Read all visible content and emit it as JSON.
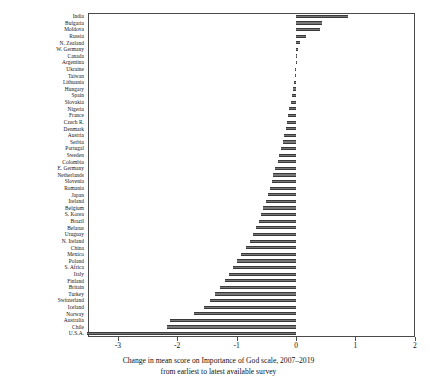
{
  "caption": {
    "line1": "Change in mean score on Importance of God scale, 2007–2019",
    "line2": "from earliest to latest available survey"
  },
  "axis": {
    "ticks": [
      "-3",
      "-2",
      "-1",
      "0",
      "1",
      "2"
    ],
    "tick_values": [
      -3,
      -2,
      -1,
      0,
      1,
      2
    ]
  },
  "chart_data": {
    "type": "bar",
    "orientation": "horizontal",
    "title": "",
    "subtitle": "",
    "xlabel": "Change in mean score on Importance of God scale, 2007–2019 from earliest to latest available survey",
    "ylabel": "",
    "xlim": [
      -3.8,
      2.0
    ],
    "grid": false,
    "legend": null,
    "bar_color": "#777777",
    "categories": [
      "India",
      "Bulgaria",
      "Moldova",
      "Russia",
      "N. Zealand",
      "W. Germany",
      "Canada",
      "Argentina",
      "Ukraine",
      "Taiwan",
      "Lithuania",
      "Hungary",
      "Spain",
      "Slovakia",
      "Nigeria",
      "France",
      "Czech R.",
      "Denmark",
      "Austria",
      "Serbia",
      "Portugal",
      "Sweden",
      "Colombia",
      "E. Germany",
      "Netherlands",
      "Slovenia",
      "Romania",
      "Japan",
      "Ireland",
      "Belgium",
      "S. Korea",
      "Brazil",
      "Belarus",
      "Uruguay",
      "N. Ireland",
      "China",
      "Mexico",
      "Poland",
      "S. Africa",
      "Italy",
      "Finland",
      "Britain",
      "Turkey",
      "Switzerland",
      "Iceland",
      "Norway",
      "Australia",
      "Chile",
      "U.S.A."
    ],
    "values": [
      0.87,
      0.43,
      0.41,
      0.17,
      0.06,
      0.04,
      0.02,
      0.01,
      -0.01,
      -0.02,
      -0.03,
      -0.05,
      -0.07,
      -0.09,
      -0.11,
      -0.13,
      -0.15,
      -0.17,
      -0.2,
      -0.22,
      -0.25,
      -0.28,
      -0.31,
      -0.35,
      -0.38,
      -0.41,
      -0.44,
      -0.47,
      -0.51,
      -0.55,
      -0.59,
      -0.63,
      -0.67,
      -0.72,
      -0.78,
      -0.84,
      -0.93,
      -1.0,
      -1.06,
      -1.12,
      -1.2,
      -1.28,
      -1.36,
      -1.45,
      -1.55,
      -1.72,
      -2.12,
      -2.18,
      -3.52
    ]
  }
}
